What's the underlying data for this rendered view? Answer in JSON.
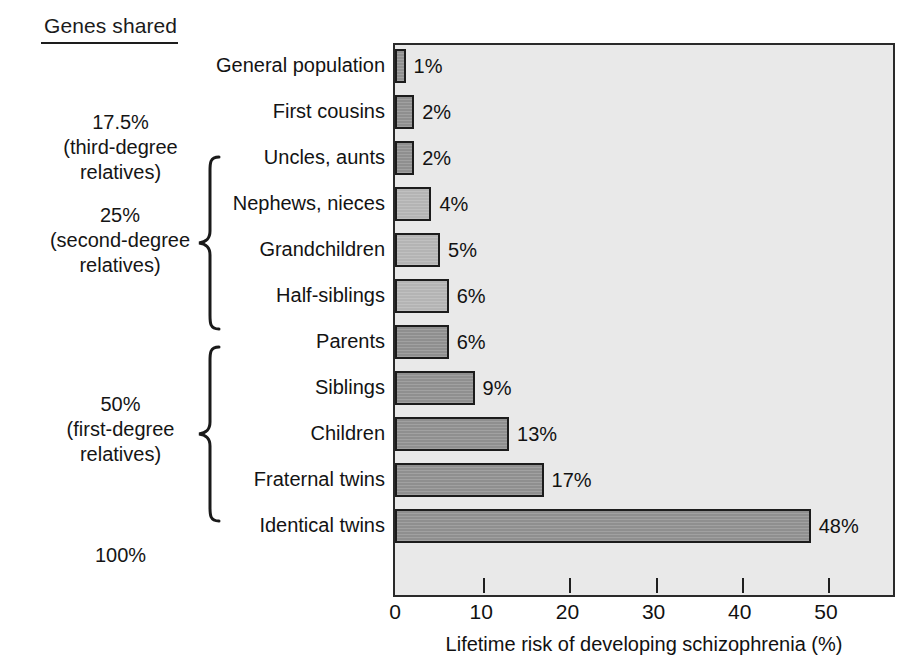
{
  "header": {
    "genes_shared_title": "Genes shared"
  },
  "groups": [
    {
      "id": "third-degree",
      "lines": [
        "17.5%",
        "(third-degree",
        "relatives)"
      ],
      "has_brace": false
    },
    {
      "id": "second-degree",
      "lines": [
        "25%",
        "(second-degree",
        "relatives)"
      ],
      "has_brace": true
    },
    {
      "id": "first-degree",
      "lines": [
        "50%",
        "(first-degree",
        "relatives)"
      ],
      "has_brace": true
    },
    {
      "id": "identical",
      "lines": [
        "100%"
      ],
      "has_brace": false
    }
  ],
  "chart_data": {
    "type": "bar",
    "orientation": "horizontal",
    "title": "",
    "xlabel": "Lifetime risk of developing schizophrenia (%)",
    "ylabel": "",
    "xlim": [
      0,
      58
    ],
    "xticks": [
      0,
      10,
      20,
      30,
      40,
      50
    ],
    "xtick_labels": [
      "0",
      "10",
      "20",
      "30",
      "40",
      "50"
    ],
    "grid": false,
    "legend": "none",
    "categories": [
      "General population",
      "First cousins",
      "Uncles, aunts",
      "Nephews, nieces",
      "Grandchildren",
      "Half-siblings",
      "Parents",
      "Siblings",
      "Children",
      "Fraternal twins",
      "Identical twins"
    ],
    "values": [
      1,
      2,
      2,
      4,
      5,
      6,
      6,
      9,
      13,
      17,
      48
    ],
    "value_labels": [
      "1%",
      "2%",
      "2%",
      "4%",
      "5%",
      "6%",
      "6%",
      "9%",
      "13%",
      "17%",
      "48%"
    ],
    "bar_shades": [
      "dark",
      "dark",
      "dark",
      "light",
      "light",
      "light",
      "dark",
      "dark",
      "dark",
      "dark",
      "dark"
    ]
  },
  "colors": {
    "plot_background": "#e9e9e9",
    "bar_dark": "#8f8f8f",
    "bar_light": "#b4b4b4",
    "outline": "#1c1c1c",
    "text": "#111111"
  }
}
